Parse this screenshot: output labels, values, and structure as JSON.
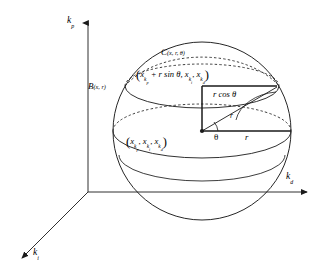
{
  "figure": {
    "type": "3d-geometry-diagram",
    "background": "#ffffff",
    "stroke_color": "#1a1a1a"
  },
  "axes": {
    "vertical": {
      "name": "k-p-axis",
      "label_base": "k",
      "label_sub": "p"
    },
    "horizontal": {
      "name": "k-d-axis",
      "label_base": "k",
      "label_sub": "d"
    },
    "oblique": {
      "name": "k-i-axis",
      "label_base": "k",
      "label_sub": "i"
    },
    "origin": {
      "x": 88,
      "y": 192
    }
  },
  "sphere": {
    "label_base": "B",
    "label_args": "(x, r)",
    "center": {
      "x": 202,
      "y": 131
    },
    "radius": 89
  },
  "circle": {
    "label_base": "C",
    "label_args": "(x, r, θ)",
    "height_y": 86,
    "radius_x": 77,
    "radius_y": 22
  },
  "labels": {
    "top_coord": {
      "open": "(",
      "x1_base": "x",
      "x1_sub": "k",
      "x1_subsub": "p",
      "plus_term": "+ r sin θ,",
      "x2_base": "x",
      "x2_sub": "k",
      "x2_subsub": "i",
      "comma": ",",
      "x3_base": "x",
      "x3_sub": "k",
      "x3_subsub": "d",
      "close": ")"
    },
    "center_coord": {
      "open": "(",
      "x1_base": "x",
      "x1_sub": "k",
      "x1_subsub": "p",
      "comma1": ",",
      "x2_base": "x",
      "x2_sub": "k",
      "x2_subsub": "i",
      "comma2": ",",
      "x3_base": "x",
      "x3_sub": "k",
      "x3_subsub": "d",
      "close": ")"
    },
    "r_cos_theta": "r cos θ",
    "radius_horizontal": "r",
    "radius_slant": "r",
    "angle": "θ"
  }
}
